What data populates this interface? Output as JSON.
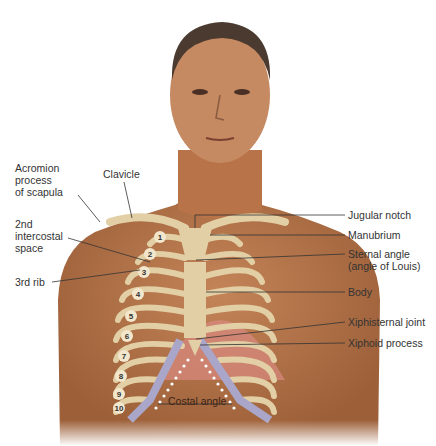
{
  "figure": {
    "colors": {
      "skin": "#b8764a",
      "skin_dark": "#8f5532",
      "bone": "#e2cfa5",
      "cartilage": "#a9a6c9",
      "intercostal": "#d98a80",
      "leader": "#333333",
      "dots": "#ffffff"
    }
  },
  "labels_left": [
    {
      "id": "acromion",
      "text": "Acromion\nprocess\nof scapula"
    },
    {
      "id": "clavicle",
      "text": "Clavicle"
    },
    {
      "id": "intercostal",
      "text": "2nd\nintercostal\nspace"
    },
    {
      "id": "rib3",
      "text": "3rd rib"
    }
  ],
  "labels_right": [
    {
      "id": "jugular",
      "text": "Jugular notch"
    },
    {
      "id": "manubrium",
      "text": "Manubrium"
    },
    {
      "id": "sternal",
      "text": "Sternal angle\n(angle of Louis)"
    },
    {
      "id": "body",
      "text": "Body"
    },
    {
      "id": "xiphisternal",
      "text": "Xiphisternal joint"
    },
    {
      "id": "xiphoid",
      "text": "Xiphoid process"
    }
  ],
  "costal_angle": "Costal angle",
  "rib_numbers": [
    "1",
    "2",
    "3",
    "4",
    "5",
    "6",
    "7",
    "8",
    "9",
    "10"
  ]
}
